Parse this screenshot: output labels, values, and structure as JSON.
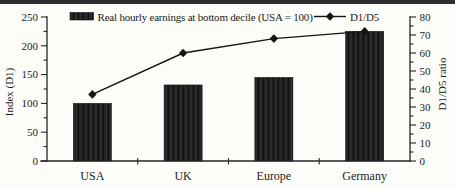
{
  "chart_data": {
    "type": "bar+line",
    "categories": [
      "USA",
      "UK",
      "Europe",
      "Germany"
    ],
    "series": [
      {
        "name": "Real hourly earnings at bottom decile (USA = 100)",
        "type": "bar",
        "axis": "left",
        "values": [
          100,
          132,
          145,
          225
        ]
      },
      {
        "name": "D1/D5",
        "type": "line",
        "axis": "right",
        "values": [
          37,
          60,
          68,
          72
        ]
      }
    ],
    "left_axis": {
      "label": "Index (D1)",
      "min": 0,
      "max": 250,
      "ticks": [
        250,
        200,
        150,
        100,
        50,
        0
      ],
      "minor_tick_step": 25
    },
    "right_axis": {
      "label": "D1/D5 ratio",
      "min": 0,
      "max": 80,
      "ticks": [
        80,
        70,
        60,
        50,
        40,
        30,
        20,
        10,
        0
      ],
      "minor_tick_step": 5
    },
    "legend_position": "top",
    "grid": "off",
    "colors": {
      "bar_fill": "#1e1e1e",
      "line_color": "#141414",
      "ink": "#1c1c1c",
      "background": "#fcfcf9",
      "top_rule": "#2e2e2e"
    }
  }
}
